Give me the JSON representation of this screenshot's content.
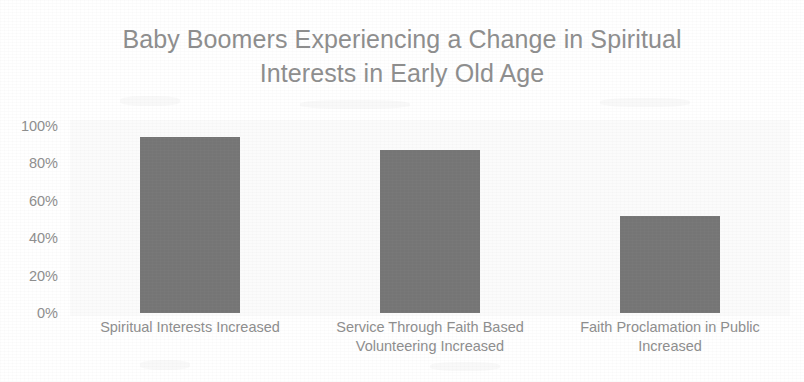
{
  "chart_data": {
    "type": "bar",
    "title": "Baby Boomers Experiencing a Change in Spiritual Interests in Early Old Age",
    "title_lines": [
      "Baby Boomers Experiencing a Change in Spiritual",
      "Interests in Early Old Age"
    ],
    "xlabel": "",
    "ylabel": "",
    "ylim": [
      0,
      100
    ],
    "grid": false,
    "legend": false,
    "legend_position": "none",
    "bar_color": "#757575",
    "text_color": "#8d8d8d",
    "plot_background": "#fbfbfb",
    "y_ticks": [
      "0%",
      "20%",
      "40%",
      "60%",
      "80%",
      "100%"
    ],
    "y_tick_values": [
      0,
      20,
      40,
      60,
      80,
      100
    ],
    "categories": [
      "Spiritual Interests Increased",
      "Service Through Faith Based Volunteering Increased",
      "Faith Proclamation in Public Increased"
    ],
    "category_lines": [
      [
        "Spiritual Interests Increased"
      ],
      [
        "Service Through Faith Based",
        "Volunteering Increased"
      ],
      [
        "Faith Proclamation in Public",
        "Increased"
      ]
    ],
    "values": [
      94,
      87,
      52
    ]
  }
}
